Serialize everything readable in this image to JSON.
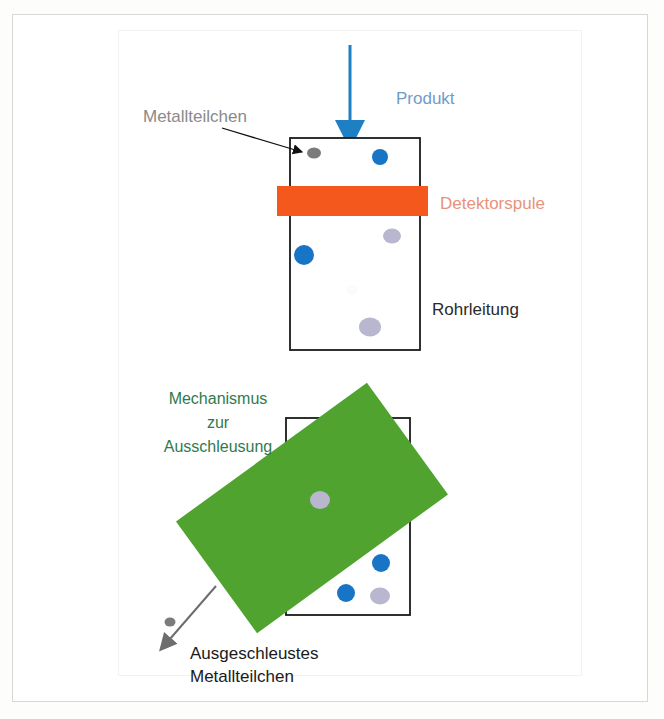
{
  "figure": {
    "language": "de"
  },
  "colors": {
    "product_arrow": "#1f7fc4",
    "product_label": "#6f9cc9",
    "detector_coil_fill": "#f4581d",
    "detector_coil_label": "#e8927a",
    "pipe_outline": "#1a1a1a",
    "metal_particle_gray": "#7b7b7b",
    "metal_particle_blue": "#1874c4",
    "metal_particle_lavender": "#b9b7d0",
    "mechanism_fill": "#4fa32e",
    "mechanism_label": "#2f7a4f",
    "reject_arrow": "#6d6d6d",
    "reject_label": "#1a1a1a",
    "background": "#ffffff",
    "frame_outer": "#d8d8d6",
    "frame_inner": "#f2f2f0"
  },
  "labels": {
    "product": "Produkt",
    "metal_particle": "Metallteilchen",
    "detector_coil": "Detektorspule",
    "pipeline": "Rohrleitung",
    "mechanism_line1": "Mechanismus",
    "mechanism_line2": "zur",
    "mechanism_line3": "Ausschleusung",
    "rejected_line1": "Ausgeschleustes",
    "rejected_line2": "Metallteilchen"
  },
  "upper_stage": {
    "pipe": {
      "x": 290,
      "y": 138,
      "width": 130,
      "height": 212
    },
    "detector_coil": {
      "x": 277,
      "y": 186,
      "width": 151,
      "height": 30
    },
    "inflow_arrow": {
      "x": 350,
      "y_start": 45,
      "y_end": 138
    },
    "callout_arrow": {
      "x1": 222,
      "y1": 128,
      "x2": 305,
      "y2": 152
    },
    "particles": [
      {
        "cx": 314,
        "cy": 153,
        "rx": 7,
        "ry": 5.5,
        "color": "#7b7b7b",
        "kind": "gray"
      },
      {
        "cx": 380,
        "cy": 157,
        "rx": 8,
        "ry": 8,
        "color": "#1874c4",
        "kind": "blue"
      },
      {
        "cx": 392,
        "cy": 236,
        "rx": 9,
        "ry": 7.5,
        "color": "#b9b7d0",
        "kind": "lavender"
      },
      {
        "cx": 304,
        "cy": 255,
        "rx": 10,
        "ry": 10,
        "color": "#1874c4",
        "kind": "blue"
      },
      {
        "cx": 370,
        "cy": 327,
        "rx": 11,
        "ry": 9.5,
        "color": "#b9b7d0",
        "kind": "lavender"
      }
    ]
  },
  "lower_stage": {
    "pipe": {
      "x": 286,
      "y": 418,
      "width": 124,
      "height": 197
    },
    "mechanism_plate": {
      "cx": 312,
      "cy": 508,
      "width": 236,
      "height": 138,
      "rotation_deg": -36
    },
    "reject_arrow": {
      "x1": 216,
      "y1": 586,
      "x2": 160,
      "y2": 650
    },
    "particles": [
      {
        "cx": 385,
        "cy": 443,
        "rx": 10,
        "ry": 8,
        "color": "#b9b7d0",
        "kind": "lavender"
      },
      {
        "cx": 320,
        "cy": 500,
        "rx": 10,
        "ry": 9,
        "color": "#b9b7d0",
        "kind": "lavender"
      },
      {
        "cx": 381,
        "cy": 563,
        "rx": 9,
        "ry": 9,
        "color": "#1874c4",
        "kind": "blue"
      },
      {
        "cx": 346,
        "cy": 593,
        "rx": 9,
        "ry": 9,
        "color": "#1874c4",
        "kind": "blue"
      },
      {
        "cx": 380,
        "cy": 596,
        "rx": 10,
        "ry": 8.5,
        "color": "#b9b7d0",
        "kind": "lavender"
      },
      {
        "cx": 170,
        "cy": 622,
        "rx": 5.5,
        "ry": 4.5,
        "color": "#7b7b7b",
        "kind": "gray"
      }
    ]
  },
  "label_positions": {
    "product": {
      "x": 396,
      "y": 104
    },
    "metal_particle": {
      "x": 143,
      "y": 122
    },
    "detector_coil": {
      "x": 440,
      "y": 209
    },
    "pipeline": {
      "x": 432,
      "y": 315
    },
    "mechanism": {
      "x": 218,
      "y": 404
    },
    "rejected": {
      "x": 190,
      "y": 659
    }
  }
}
